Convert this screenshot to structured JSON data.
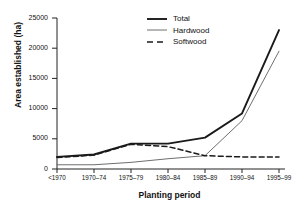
{
  "chart_data": {
    "type": "line",
    "title": "",
    "xlabel": "Planting period",
    "ylabel": "Area established (ha)",
    "categories": [
      "<1970",
      "1970–74",
      "1975–79",
      "1980–84",
      "1985–89",
      "1990–94",
      "1995–99"
    ],
    "ylim": [
      0,
      25000
    ],
    "yticks": [
      0,
      5000,
      10000,
      15000,
      20000,
      25000
    ],
    "ytick_labels": [
      "0",
      "5000",
      "10000",
      "15000",
      "20000",
      "25000"
    ],
    "grid": false,
    "legend_position": "top-center",
    "series": [
      {
        "name": "Total",
        "style": "solid",
        "width": 1.9,
        "color": "#1a1a1a",
        "values": [
          2000,
          2400,
          4200,
          4200,
          5200,
          9200,
          23000
        ]
      },
      {
        "name": "Hardwood",
        "style": "solid",
        "width": 1.0,
        "color": "#6e6e6e",
        "values": [
          700,
          700,
          1100,
          1700,
          2200,
          8000,
          19500
        ]
      },
      {
        "name": "Softwood",
        "style": "dashed",
        "width": 1.5,
        "color": "#1a1a1a",
        "values": [
          1900,
          2300,
          4100,
          3700,
          2200,
          2000,
          2000
        ]
      }
    ]
  },
  "axes": {
    "y_axis_title": "Area established (ha)",
    "x_axis_title": "Planting period"
  },
  "legend": {
    "entries": [
      {
        "label": "Total"
      },
      {
        "label": "Hardwood"
      },
      {
        "label": "Softwood"
      }
    ]
  }
}
